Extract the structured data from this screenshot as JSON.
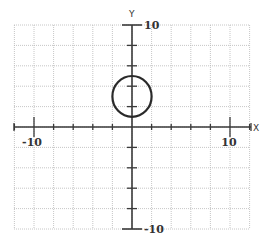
{
  "figure": {
    "type": "coordinate-plane",
    "x_axis": {
      "name": "X",
      "min": -12,
      "max": 12,
      "tick_step": 2,
      "labels": [
        {
          "value": -10,
          "text": "-10"
        },
        {
          "value": 10,
          "text": "10"
        }
      ]
    },
    "y_axis": {
      "name": "Y",
      "min": -10,
      "max": 10,
      "tick_step": 2,
      "labels": [
        {
          "value": 10,
          "text": "10"
        },
        {
          "value": -10,
          "text": "-10"
        }
      ]
    },
    "grid": {
      "step": 2,
      "on": true
    },
    "shapes": [
      {
        "type": "circle",
        "center": [
          0,
          3
        ],
        "radius": 2
      }
    ]
  },
  "layout": {
    "origin_px": [
      132,
      127
    ],
    "x_unit_px": 9.8,
    "y_unit_px": 10.2,
    "grid_left_px": 14,
    "grid_right_px": 249,
    "grid_top_px": 25,
    "grid_bottom_px": 229
  }
}
